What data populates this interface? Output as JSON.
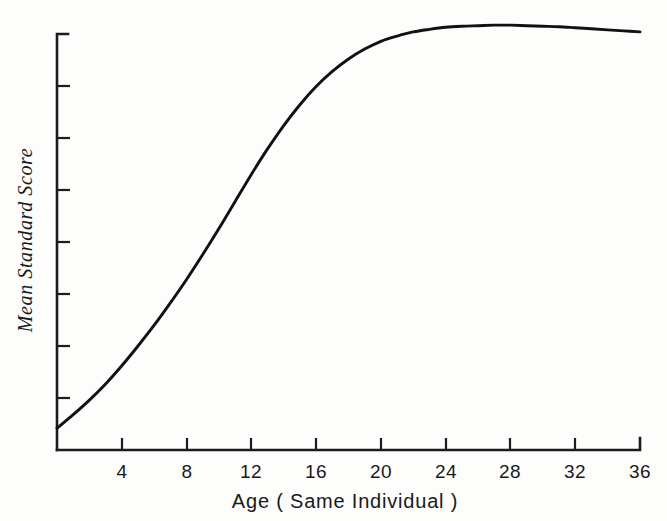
{
  "chart_data": {
    "type": "line",
    "title": "",
    "xlabel": "Age ( Same  Individual )",
    "ylabel": "Mean Standard Score",
    "xlim": [
      0,
      36
    ],
    "ylim": [
      0,
      8
    ],
    "grid": false,
    "legend": null,
    "x_tick_labels": [
      "4",
      "8",
      "12",
      "16",
      "20",
      "24",
      "28",
      "32",
      "36"
    ],
    "x_ticks": [
      4,
      8,
      12,
      16,
      20,
      24,
      28,
      32,
      36
    ],
    "y_tick_labels": [
      "",
      "",
      "",
      "",
      "",
      "",
      "",
      "",
      ""
    ],
    "y_ticks": [
      0,
      1,
      2,
      3,
      4,
      5,
      6,
      7,
      8
    ],
    "series": [
      {
        "name": "Mean Standard Score",
        "x": [
          0,
          1,
          2,
          3,
          4,
          5,
          6,
          7,
          8,
          9,
          10,
          11,
          12,
          13,
          14,
          15,
          16,
          17,
          18,
          19,
          20,
          21,
          22,
          23,
          24,
          25,
          26,
          27,
          28,
          29,
          30,
          31,
          32,
          33,
          34,
          35,
          36
        ],
        "y": [
          0.42,
          0.68,
          0.96,
          1.27,
          1.62,
          2.0,
          2.4,
          2.83,
          3.28,
          3.76,
          4.26,
          4.78,
          5.3,
          5.79,
          6.24,
          6.64,
          6.99,
          7.28,
          7.52,
          7.71,
          7.86,
          7.96,
          8.04,
          8.09,
          8.13,
          8.15,
          8.16,
          8.17,
          8.17,
          8.16,
          8.15,
          8.14,
          8.12,
          8.1,
          8.08,
          8.06,
          8.04
        ]
      }
    ],
    "annotations": []
  },
  "axes": {
    "x_axis_name": "age-axis",
    "y_axis_name": "mean-standard-score-axis",
    "tick_direction_x": "up",
    "tick_direction_y": "right"
  },
  "style": {
    "line_color": "#111111",
    "axis_color": "#1c1c1c",
    "background": "#fdfdfc"
  }
}
